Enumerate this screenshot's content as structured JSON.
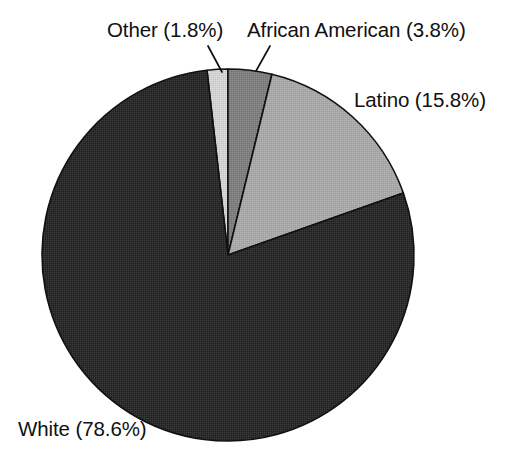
{
  "chart_data": {
    "type": "pie",
    "title": "",
    "subtitle": "",
    "xlabel": "",
    "ylabel": "",
    "legend_position": "none",
    "grid": false,
    "label_format": "{name} ({value}%)",
    "total_percent": 100.0,
    "categories": [
      "Other",
      "African American",
      "Latino",
      "White"
    ],
    "values": [
      1.8,
      3.8,
      15.8,
      78.6
    ],
    "slices": [
      {
        "name": "Other",
        "value": 1.8,
        "label": "Other (1.8%)",
        "color": "#d2d2d2",
        "start_angle_deg": -6.5,
        "sweep_deg": 6.48,
        "has_leader_line": true
      },
      {
        "name": "African American",
        "value": 3.8,
        "label": "African American (3.8%)",
        "color": "#7f7f7f",
        "start_angle_deg": -0.02,
        "sweep_deg": 13.68,
        "has_leader_line": true
      },
      {
        "name": "Latino",
        "value": 15.8,
        "label": "Latino (15.8%)",
        "color": "#a9a9a9",
        "start_angle_deg": 13.66,
        "sweep_deg": 56.88,
        "has_leader_line": false
      },
      {
        "name": "White",
        "value": 78.6,
        "label": "White (78.6%)",
        "color": "#2b2b2b",
        "start_angle_deg": 70.54,
        "sweep_deg": 282.96,
        "has_leader_line": false
      }
    ],
    "geometry": {
      "center_x": 228,
      "center_y": 255,
      "radius": 186,
      "start_angle_deg": -6.5,
      "direction": "clockwise"
    },
    "background_color": "#ffffff",
    "outline_color": "#111111"
  },
  "labels": {
    "other": "Other (1.8%)",
    "african_american": "African American (3.8%)",
    "latino": "Latino (15.8%)",
    "white": "White (78.6%)"
  }
}
